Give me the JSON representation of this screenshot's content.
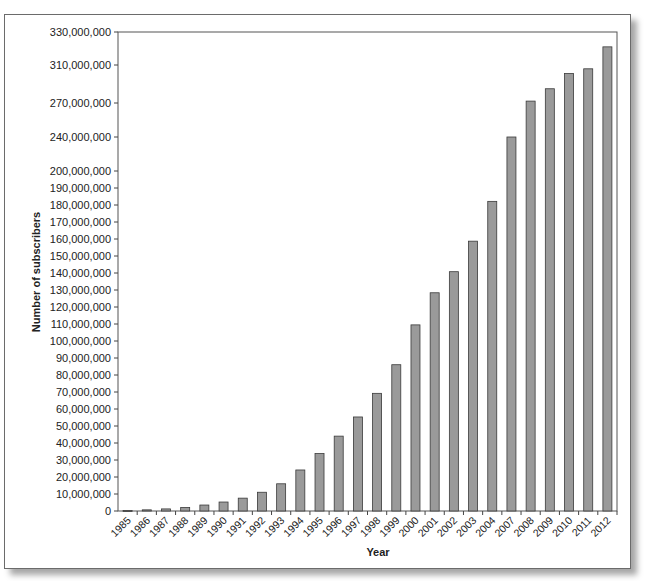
{
  "chart_data": {
    "type": "bar",
    "title": "",
    "xlabel": "Year",
    "ylabel": "Number of subscribers",
    "categories": [
      "1985",
      "1986",
      "1987",
      "1988",
      "1989",
      "1990",
      "1991",
      "1992",
      "1993",
      "1994",
      "1995",
      "1996",
      "1997",
      "1998",
      "1999",
      "2000",
      "2001",
      "2002",
      "2003",
      "2004",
      "2007",
      "2008",
      "2009",
      "2010",
      "2011",
      "2012"
    ],
    "values": [
      340000,
      680000,
      1230000,
      2070000,
      3510000,
      5280000,
      7560000,
      11030000,
      16010000,
      24130000,
      33790000,
      44040000,
      55310000,
      69210000,
      86050000,
      109480000,
      128370000,
      140770000,
      158720000,
      182140000,
      240000000,
      272000000,
      285000000,
      301000000,
      306000000,
      321000000
    ],
    "yticks": [
      0,
      10000000,
      20000000,
      30000000,
      40000000,
      50000000,
      60000000,
      70000000,
      80000000,
      90000000,
      100000000,
      110000000,
      120000000,
      130000000,
      140000000,
      150000000,
      160000000,
      170000000,
      180000000,
      190000000,
      200000000,
      240000000,
      270000000,
      310000000,
      330000000
    ],
    "ytick_labels": [
      "0",
      "10,000,000",
      "20,000,000",
      "30,000,000",
      "40,000,000",
      "50,000,000",
      "60,000,000",
      "70,000,000",
      "80,000,000",
      "90,000,000",
      "100,000,000",
      "110,000,000",
      "120,000,000",
      "130,000,000",
      "140,000,000",
      "150,000,000",
      "160,000,000",
      "170,000,000",
      "180,000,000",
      "190,000,000",
      "200,000,000",
      "240,000,000",
      "270,000,000",
      "310,000,000",
      "330,000,000"
    ],
    "ytick_pixels": [
      511,
      494,
      477,
      460,
      443,
      426,
      409,
      392,
      375,
      358,
      341,
      324,
      307,
      290,
      273,
      256,
      239,
      222,
      205,
      188,
      171,
      137,
      103,
      65,
      32
    ],
    "ylim": [
      0,
      330000000
    ],
    "grid": false,
    "legend": null,
    "bar_color": "#9a9a9a",
    "bar_edge": "#3a3a3a"
  }
}
